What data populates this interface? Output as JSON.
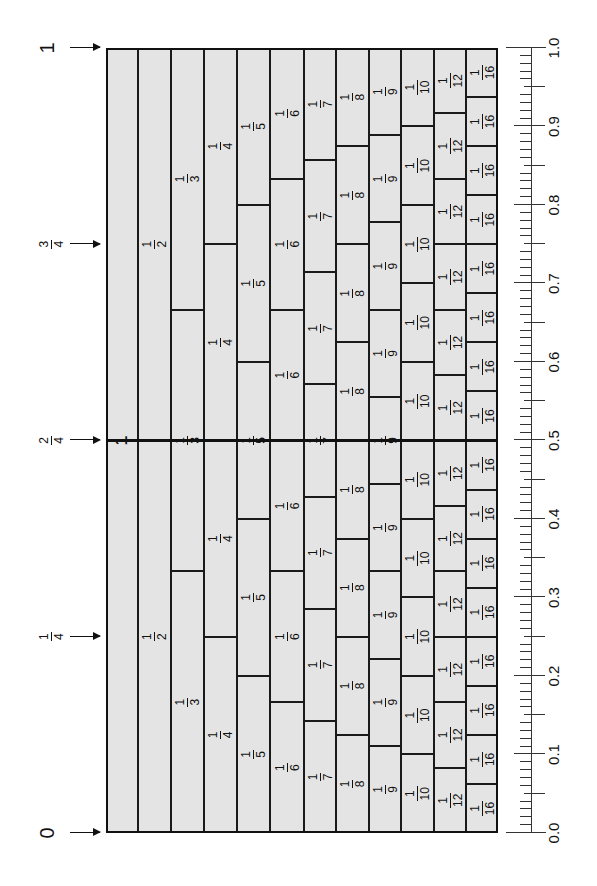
{
  "colors": {
    "cell_fill": "#e4e4e4",
    "line": "#111111"
  },
  "markers": [
    {
      "value": 0,
      "label": "0",
      "type": "whole"
    },
    {
      "value": 0.25,
      "num": "1",
      "den": "4",
      "type": "fraction"
    },
    {
      "value": 0.5,
      "num": "2",
      "den": "4",
      "type": "fraction"
    },
    {
      "value": 0.75,
      "num": "3",
      "den": "4",
      "type": "fraction"
    },
    {
      "value": 1,
      "label": "1",
      "type": "whole"
    }
  ],
  "rows": [
    {
      "denominator": 1,
      "label": "1"
    },
    {
      "denominator": 2,
      "num": "1",
      "den": "2"
    },
    {
      "denominator": 3,
      "num": "1",
      "den": "3"
    },
    {
      "denominator": 4,
      "num": "1",
      "den": "4"
    },
    {
      "denominator": 5,
      "num": "1",
      "den": "5"
    },
    {
      "denominator": 6,
      "num": "1",
      "den": "6"
    },
    {
      "denominator": 7,
      "num": "1",
      "den": "7"
    },
    {
      "denominator": 8,
      "num": "1",
      "den": "8"
    },
    {
      "denominator": 9,
      "num": "1",
      "den": "9"
    },
    {
      "denominator": 10,
      "num": "1",
      "den": "10"
    },
    {
      "denominator": 12,
      "num": "1",
      "den": "12"
    },
    {
      "denominator": 16,
      "num": "1",
      "den": "16"
    }
  ],
  "ruler": {
    "min": 0.0,
    "max": 1.0,
    "minor_step": 0.01,
    "labels": [
      "0.0",
      "0.1",
      "0.2",
      "0.3",
      "0.4",
      "0.5",
      "0.6",
      "0.7",
      "0.8",
      "0.9",
      "1.0"
    ]
  }
}
